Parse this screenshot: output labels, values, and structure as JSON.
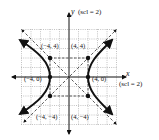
{
  "figure": {
    "type": "hyperbola",
    "equation_form": "x^2/16 - y^2/16 = 1",
    "axes": {
      "x_label": "x",
      "y_label": "y",
      "x_scale_label": "(scl = 2)",
      "y_scale_label": "(scl = 2)"
    },
    "vertices": [
      {
        "label": "(−4, 0)",
        "x": -4,
        "y": 0
      },
      {
        "label": "(4, 0)",
        "x": 4,
        "y": 0
      }
    ],
    "rectangle_corners": [
      {
        "label": "(−4, 4)",
        "x": -4,
        "y": 4
      },
      {
        "label": "(4, 4)",
        "x": 4,
        "y": 4
      },
      {
        "label": "(−4, −4)",
        "x": -4,
        "y": -4
      },
      {
        "label": "(4, −4)",
        "x": 4,
        "y": -4
      }
    ],
    "asymptotes": [
      "y = x",
      "y = −x"
    ],
    "colors": {
      "curve": "#111111",
      "grid": "#9a9a9a",
      "dashed": "#333333"
    }
  }
}
